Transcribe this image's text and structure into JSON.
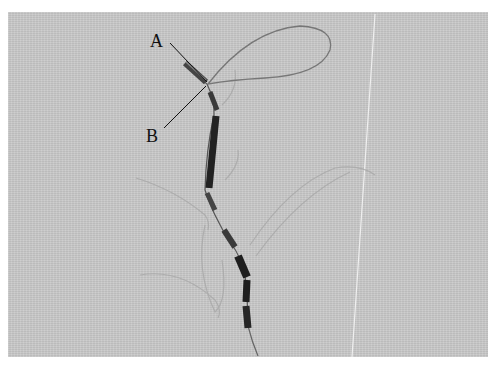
{
  "figure": {
    "labels": {
      "a": "A",
      "b": "B"
    },
    "colors": {
      "background": "#c9c9c9",
      "bead": "#2a2a2a",
      "wire": "#6a6a6a",
      "sketch": "#a6a6a6",
      "fold_line": "#efefef"
    }
  }
}
